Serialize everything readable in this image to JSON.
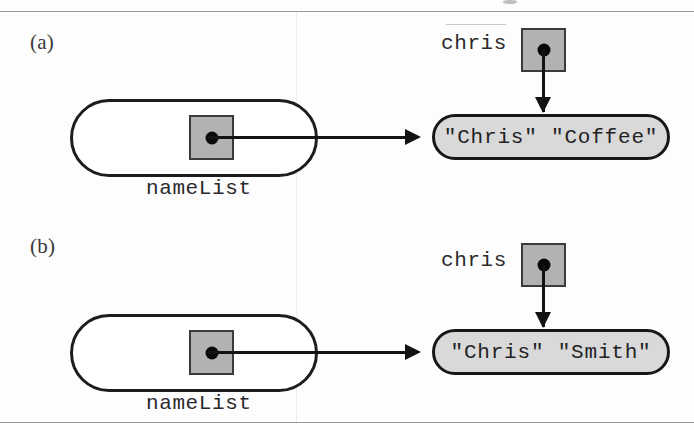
{
  "figure": {
    "ink_color": "#131315",
    "cell_fill": "#b2b2b2",
    "value_fill": "#d9d9d9",
    "list_fill": "#ffffff"
  },
  "panels": [
    {
      "id": "a",
      "letter": "(a)",
      "list": {
        "label": "nameList",
        "cell_name": "nameList-element-pointer"
      },
      "variable": {
        "label": "chris",
        "cell_name": "chris-variable-pointer"
      },
      "value": {
        "text": "\"Chris\" \"Coffee\""
      }
    },
    {
      "id": "b",
      "letter": "(b)",
      "list": {
        "label": "nameList",
        "cell_name": "nameList-element-pointer"
      },
      "variable": {
        "label": "chris",
        "cell_name": "chris-variable-pointer"
      },
      "value": {
        "text": "\"Chris\" \"Smith\""
      }
    }
  ]
}
